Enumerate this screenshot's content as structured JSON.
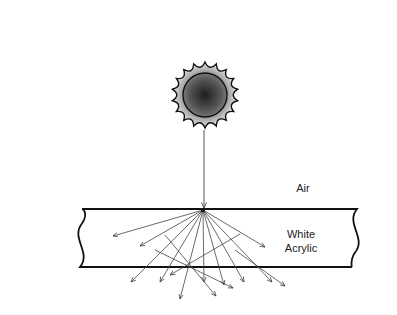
{
  "diagram": {
    "labels": {
      "air": "Air",
      "material_line1": "White",
      "material_line2": "Acrylic"
    },
    "source": {
      "icon": "sun-icon",
      "cx": 205,
      "cy": 95,
      "core_r": 22,
      "ray_r": 33,
      "points": 18
    },
    "incident_ray": {
      "x1": 204,
      "y1": 130,
      "x2": 204,
      "y2": 208
    },
    "panel": {
      "top_y": 209,
      "bottom_y": 267,
      "left_x": 80,
      "right_x": 357
    },
    "scatter_origin": {
      "x": 203,
      "y": 210
    },
    "scattered_rays": [
      [
        203,
        210,
        113,
        236
      ],
      [
        203,
        210,
        140,
        246
      ],
      [
        203,
        210,
        131,
        282
      ],
      [
        203,
        210,
        160,
        282
      ],
      [
        203,
        210,
        180,
        299
      ],
      [
        203,
        210,
        204,
        282
      ],
      [
        203,
        210,
        224,
        285
      ],
      [
        203,
        210,
        244,
        282
      ],
      [
        203,
        210,
        272,
        282
      ],
      [
        203,
        210,
        265,
        247
      ]
    ],
    "bounced_rays": [
      [
        165,
        235,
        216,
        296
      ],
      [
        155,
        250,
        233,
        288
      ],
      [
        240,
        234,
        170,
        275
      ],
      [
        235,
        250,
        285,
        286
      ]
    ],
    "colors": {
      "line": "#333333",
      "panel_edge": "#111111",
      "sun_core": "#3a3a3a",
      "sun_rim": "#d8d8d8"
    }
  }
}
